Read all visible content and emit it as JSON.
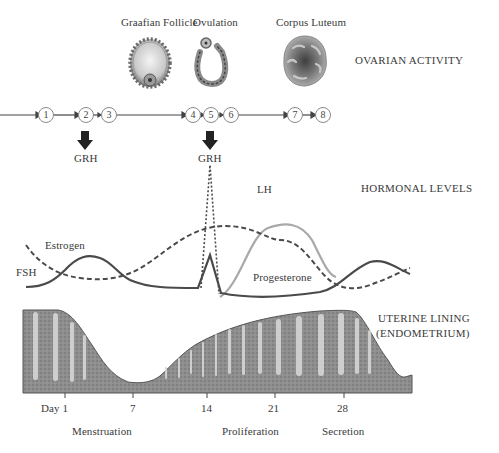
{
  "ovarian": {
    "section_label": "OVARIAN ACTIVITY",
    "stages": [
      {
        "label": "Graafian Follicle",
        "icon": "graafian-follicle-illustration"
      },
      {
        "label": "Ovulation",
        "icon": "ovulation-illustration"
      },
      {
        "label": "Corpus Luteum",
        "icon": "corpus-luteum-illustration"
      }
    ],
    "sequence": [
      "1",
      "2",
      "3",
      "4",
      "5",
      "6",
      "7",
      "8"
    ],
    "grh_labels": [
      "GRH",
      "GRH"
    ]
  },
  "hormones": {
    "section_label": "HORMONAL LEVELS",
    "curves": [
      {
        "name": "FSH",
        "style": "solid",
        "color": "#4a4a4a"
      },
      {
        "name": "Estrogen",
        "style": "dashed",
        "color": "#4a4a4a"
      },
      {
        "name": "LH",
        "style": "dotted",
        "color": "#4a4a4a"
      },
      {
        "name": "Progesterone",
        "style": "solid",
        "color": "#a8a8a8"
      }
    ],
    "labels": {
      "fsh": "FSH",
      "estrogen": "Estrogen",
      "lh": "LH",
      "progesterone": "Progesterone"
    }
  },
  "uterine": {
    "section_label_line1": "UTERINE LINING",
    "section_label_line2": "(ENDOMETRIUM)",
    "day_ticks": [
      "Day 1",
      "7",
      "14",
      "21",
      "28"
    ],
    "phases": [
      "Menstruation",
      "Proliferation",
      "Secretion"
    ]
  },
  "colors": {
    "ink": "#3a3a3a",
    "tissue": "#8c8c8c",
    "tissue_dark": "#6e6e6e",
    "gland": "#d8d8d8",
    "progesterone": "#a8a8a8"
  }
}
